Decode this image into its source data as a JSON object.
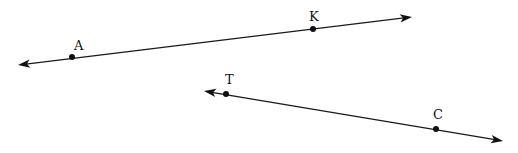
{
  "diagram": {
    "type": "geometry-lines",
    "colors": {
      "stroke": "#1a1a1a",
      "background": "#ffffff"
    },
    "lines": [
      {
        "name": "line-AK",
        "start": [
          18,
          65
        ],
        "end": [
          412,
          17
        ],
        "arrows": "both",
        "points": [
          {
            "label": "A",
            "x": 72,
            "y": 57,
            "label_x": 74,
            "label_y": 50
          },
          {
            "label": "K",
            "x": 313,
            "y": 29,
            "label_x": 309,
            "label_y": 21
          }
        ]
      },
      {
        "name": "line-TC",
        "start": [
          204,
          91
        ],
        "end": [
          503,
          141
        ],
        "arrows": "both",
        "points": [
          {
            "label": "T",
            "x": 226,
            "y": 94,
            "label_x": 225,
            "label_y": 84
          },
          {
            "label": "C",
            "x": 436,
            "y": 129,
            "label_x": 433,
            "label_y": 119
          }
        ]
      }
    ]
  }
}
